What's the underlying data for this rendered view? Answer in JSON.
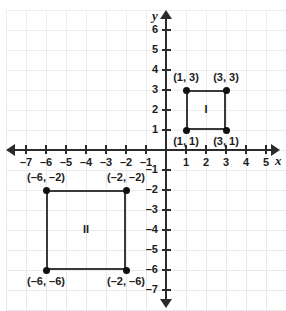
{
  "figure": {
    "background_color": "#ffffff",
    "grid_color": "#e6e6e6",
    "axis_color": "#2b2b2b",
    "shape_color": "#3a3a3a",
    "point_color": "#111111"
  },
  "chart_data": {
    "type": "scatter",
    "title": "",
    "xlabel": "x",
    "ylabel": "y",
    "xlim": [
      -8,
      6
    ],
    "ylim": [
      -7.6,
      7
    ],
    "grid": true,
    "legend": "none",
    "unit_px": 20,
    "origin_px": {
      "x": 166,
      "y": 150
    },
    "x_ticks": [
      -7,
      -6,
      -5,
      -4,
      -3,
      -2,
      -1,
      1,
      2,
      3,
      4,
      5
    ],
    "x_tick_labels": [
      "–7",
      "–6",
      "–5",
      "–4",
      "–3",
      "–2",
      "–1",
      "1",
      "2",
      "3",
      "4",
      "5"
    ],
    "y_ticks": [
      6,
      5,
      4,
      3,
      2,
      1,
      -1,
      -2,
      -3,
      -4,
      -5,
      -6,
      -7
    ],
    "y_tick_labels": [
      "6",
      "5",
      "4",
      "3",
      "2",
      "1",
      "–1",
      "–2",
      "–3",
      "–4",
      "–5",
      "–6",
      "–7"
    ],
    "shapes": [
      {
        "name": "I",
        "kind": "square",
        "name_position": [
          2,
          2
        ],
        "x_range": [
          1,
          3
        ],
        "y_range": [
          1,
          3
        ],
        "vertices": [
          {
            "label": "(1, 3)",
            "x": 1,
            "y": 3,
            "label_side": "above"
          },
          {
            "label": "(3, 3)",
            "x": 3,
            "y": 3,
            "label_side": "above"
          },
          {
            "label": "(1, 1)",
            "x": 1,
            "y": 1,
            "label_side": "below"
          },
          {
            "label": "(3, 1)",
            "x": 3,
            "y": 1,
            "label_side": "below"
          }
        ]
      },
      {
        "name": "II",
        "kind": "square",
        "name_position": [
          -4,
          -4
        ],
        "x_range": [
          -6,
          -2
        ],
        "y_range": [
          -6,
          -2
        ],
        "vertices": [
          {
            "label": "(–6, –2)",
            "x": -6,
            "y": -2,
            "label_side": "above"
          },
          {
            "label": "(–2, –2)",
            "x": -2,
            "y": -2,
            "label_side": "above"
          },
          {
            "label": "(–6, –6)",
            "x": -6,
            "y": -6,
            "label_side": "below"
          },
          {
            "label": "(–2, –6)",
            "x": -2,
            "y": -6,
            "label_side": "below"
          }
        ]
      }
    ]
  }
}
